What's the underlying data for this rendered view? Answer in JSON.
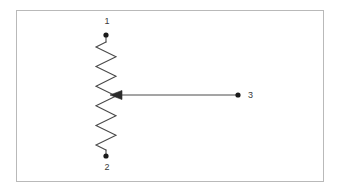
{
  "figure": {
    "name": "potentiometer-schematic",
    "background_color": "#ffffff",
    "frame": {
      "name": "figure-border",
      "color": "#b9b9b9",
      "stroke_width": 1,
      "x": 16,
      "y": 10,
      "width": 308,
      "height": 172
    },
    "symbol": {
      "type": "zigzag-resistor",
      "stroke_color": "#4a4a4a",
      "stroke_width": 1.1,
      "axis_x": 106,
      "top_y": 42,
      "bottom_y": 150,
      "amplitude": 10,
      "zig_count": 11
    },
    "wiper": {
      "name": "wiper-arrow",
      "stroke_color": "#4a4a4a",
      "stroke_width": 1,
      "y": 95,
      "from_x": 238,
      "to_x": 110,
      "arrowhead_length": 11,
      "arrowhead_half_width": 4.5
    },
    "terminals": [
      {
        "id": "terminal-1",
        "label": "1",
        "dot_x": 106,
        "dot_y": 35,
        "dot_radius": 2.6,
        "label_x": 107,
        "label_y": 24,
        "lead_from_y": 35,
        "lead_to_y": 42,
        "color": "#1a1a1a"
      },
      {
        "id": "terminal-2",
        "label": "2",
        "dot_x": 106,
        "dot_y": 156,
        "dot_radius": 2.6,
        "label_x": 107,
        "label_y": 170,
        "lead_from_y": 150,
        "lead_to_y": 156,
        "color": "#1a1a1a"
      },
      {
        "id": "terminal-3",
        "label": "3",
        "dot_x": 238,
        "dot_y": 95,
        "dot_radius": 2.6,
        "label_x": 248,
        "label_y": 98,
        "color": "#1a1a1a"
      }
    ]
  }
}
